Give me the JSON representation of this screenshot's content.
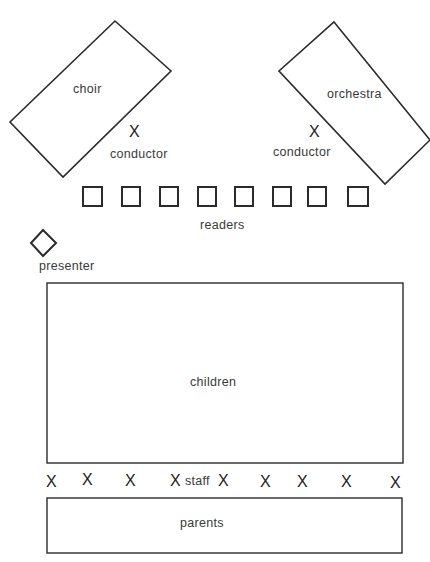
{
  "diagram": {
    "title": "",
    "areas": {
      "choir": {
        "label": "choir"
      },
      "orchestra": {
        "label": "orchestra"
      },
      "children": {
        "label": "children"
      },
      "parents": {
        "label": "parents"
      }
    },
    "conductors": [
      {
        "marker": "X",
        "label": "conductor"
      },
      {
        "marker": "X",
        "label": "conductor"
      }
    ],
    "readers": {
      "label": "readers",
      "count": 8
    },
    "presenter": {
      "label": "presenter",
      "shape": "diamond"
    },
    "staff": {
      "label": "staff",
      "marker": "X",
      "markers": [
        "X",
        "X",
        "X",
        "X",
        "X",
        "X",
        "X",
        "X",
        "X"
      ]
    }
  },
  "colors": {
    "stroke": "#2b2b2b",
    "text": "#3a3a3a",
    "background": "#ffffff"
  }
}
